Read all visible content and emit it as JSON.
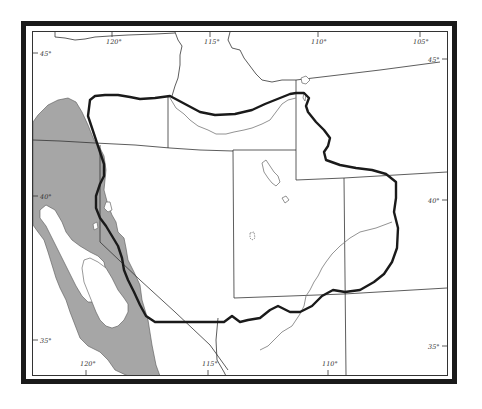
{
  "map": {
    "type": "regional outline map",
    "colors": {
      "frame": "#1a1a1a",
      "shaded_region": "#a6a6a6",
      "boundary": "#1a1a1a",
      "state_lines": "#333333",
      "rivers": "#777777",
      "background": "#ffffff"
    },
    "longitude_labels_top": [
      "120°",
      "115°",
      "110°",
      "105°"
    ],
    "longitude_labels_bottom": [
      "120°",
      "115°",
      "110°"
    ],
    "latitude_labels_left": [
      "45°",
      "40°",
      "35°"
    ],
    "latitude_labels_right": [
      "45°",
      "40°",
      "35°"
    ],
    "legend": {
      "shaded_area": "gray shaded region (west)",
      "thick_line": "bold boundary outline"
    }
  }
}
